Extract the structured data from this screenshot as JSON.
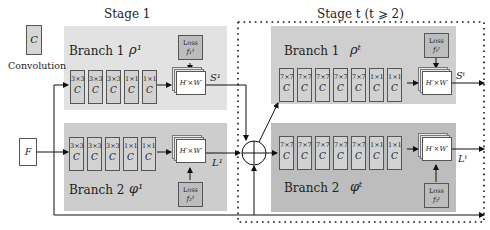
{
  "legend": {
    "conv_symbol": "C",
    "conv_label": "Convolution"
  },
  "input": {
    "label": "F"
  },
  "stage1": {
    "title": "Stage 1",
    "branch1": {
      "label": "Branch 1",
      "symbol": "ρ¹",
      "kernels": [
        "3×3",
        "3×3",
        "3×3",
        "1×1",
        "1×1"
      ],
      "conv_symbol": "C",
      "output_size": "H′×W′",
      "output_label": "S¹",
      "loss_label": "Loss",
      "loss_symbol": "f₁¹"
    },
    "branch2": {
      "label": "Branch 2",
      "symbol": "φ¹",
      "kernels": [
        "3×3",
        "3×3",
        "3×3",
        "1×1",
        "1×1"
      ],
      "conv_symbol": "C",
      "output_size": "H′×W′",
      "output_label": "L¹",
      "loss_label": "Loss",
      "loss_symbol": "f₂¹"
    }
  },
  "staget": {
    "title": "Stage t  (t ⩾ 2)",
    "branch1": {
      "label": "Branch 1",
      "symbol": "ρᵗ",
      "kernels": [
        "7×7",
        "7×7",
        "7×7",
        "7×7",
        "7×7",
        "1×1",
        "1×1"
      ],
      "conv_symbol": "C",
      "output_size": "H′×W′",
      "output_label": "Sᵗ",
      "loss_label": "Loss",
      "loss_symbol": "f₁ᵗ"
    },
    "branch2": {
      "label": "Branch 2",
      "symbol": "φᵗ",
      "kernels": [
        "7×7",
        "7×7",
        "7×7",
        "7×7",
        "7×7",
        "1×1",
        "1×1"
      ],
      "conv_symbol": "C",
      "output_size": "H′×W′",
      "output_label": "Lᵗ",
      "loss_label": "Loss",
      "loss_symbol": "f₂ᵗ"
    }
  },
  "colors": {
    "stage1_branch1_bg": "#e2e2e2",
    "stage1_branch2_bg": "#cdcdcd",
    "staget_branch1_bg": "#cfcfcf",
    "staget_branch2_bg": "#bdbdbd",
    "conv_fill": "#d6d6d6",
    "loss_fill": "#bdbdbd"
  }
}
